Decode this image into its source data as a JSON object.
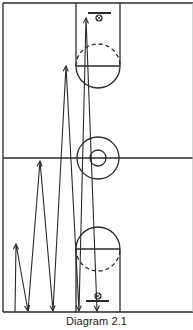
{
  "caption": "Diagram 2.1",
  "colors": {
    "line": "#2a2a2a",
    "background": "#ffffff"
  },
  "court": {
    "left": 3,
    "right": 193,
    "top": 3,
    "midcourt": 158,
    "baseline": 312,
    "lane": {
      "x1": 76,
      "x2": 120
    },
    "top_end": {
      "foul_line_y": 66,
      "circle_r": 22,
      "backboard_y": 13,
      "hoop": [
        99,
        18
      ]
    },
    "bottom_end": {
      "foul_line_y": 249,
      "circle_r": 22,
      "backboard_y": 301,
      "hoop": [
        98,
        296
      ]
    },
    "center_circle": {
      "cx": 98,
      "cy": 158,
      "outer_r": 21,
      "inner_r": 8
    }
  },
  "path": {
    "description": "zigzag sprint drill: up and back to progressively farther lines",
    "points": [
      [
        15,
        312
      ],
      [
        16,
        244
      ],
      [
        28,
        311
      ],
      [
        40,
        161
      ],
      [
        53,
        311
      ],
      [
        66,
        66
      ],
      [
        79,
        311
      ],
      [
        86,
        18
      ],
      [
        97,
        311
      ]
    ]
  }
}
